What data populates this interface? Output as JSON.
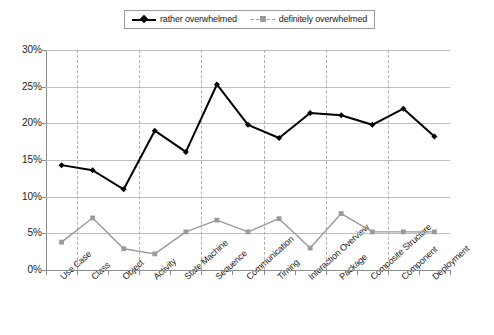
{
  "chart_data": {
    "type": "line",
    "title": "",
    "xlabel": "",
    "ylabel": "",
    "ylim": [
      0,
      30
    ],
    "ytick_labels": [
      "0%",
      "5%",
      "10%",
      "15%",
      "20%",
      "25%",
      "30%"
    ],
    "ytick_values": [
      0,
      5,
      10,
      15,
      20,
      25,
      30
    ],
    "grid": "horizontal solid gridlines at every 5%; vertical dashed gridlines at alternating categories",
    "legend_position": "top-center",
    "categories": [
      "Use Case",
      "Class",
      "Object",
      "Activity",
      "State Machine",
      "Sequence",
      "Communication",
      "Timing",
      "Interaction Overview",
      "Package",
      "Composite Structure",
      "Component",
      "Deployment"
    ],
    "series": [
      {
        "name": "rather overwhelmed",
        "color": "#000000",
        "marker": "diamond",
        "line_style": "solid",
        "values": [
          14.3,
          13.6,
          11.0,
          19.0,
          16.1,
          25.3,
          19.8,
          18.0,
          21.4,
          21.1,
          19.8,
          22.0,
          18.2
        ]
      },
      {
        "name": "definitely overwhelmed",
        "color": "#9a9a9a",
        "marker": "square",
        "line_style": "solid",
        "values": [
          3.8,
          7.1,
          2.9,
          2.2,
          5.2,
          6.8,
          5.2,
          7.0,
          3.0,
          7.7,
          5.2,
          5.2,
          5.2
        ]
      }
    ]
  },
  "legend": {
    "entries": [
      {
        "label": "rather overwhelmed"
      },
      {
        "label": "definitely overwhelmed"
      }
    ]
  },
  "colors": {
    "series_1": "#000000",
    "series_2": "#9a9a9a",
    "gridline": "#bfbfbf",
    "axis": "#8c8c8c",
    "background": "#ffffff"
  }
}
